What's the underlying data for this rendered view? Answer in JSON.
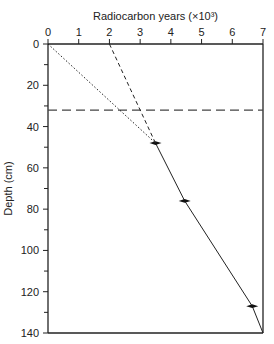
{
  "chart_data": {
    "type": "line",
    "title": "",
    "xlabel": "Radiocarbon years (×10³)",
    "ylabel": "Depth (cm)",
    "xlim": [
      0,
      7
    ],
    "ylim": [
      0,
      140
    ],
    "y_inverted": true,
    "x_axis_position": "top",
    "x_ticks": [
      0,
      1,
      2,
      3,
      4,
      5,
      6,
      7
    ],
    "y_ticks": [
      0,
      20,
      40,
      60,
      80,
      100,
      120,
      140
    ],
    "y_minor_ticks": [
      10,
      30,
      50,
      70,
      90,
      110,
      130
    ],
    "grid": false,
    "series": [
      {
        "name": "dated-profile",
        "style": "solid",
        "x": [
          3.5,
          4.45,
          6.65,
          7.0
        ],
        "y": [
          48,
          76,
          127,
          140
        ],
        "markers": [
          true,
          true,
          true,
          false
        ]
      },
      {
        "name": "extrapolation-to-surface",
        "style": "dotted",
        "x": [
          0,
          3.5
        ],
        "y": [
          0,
          48
        ]
      },
      {
        "name": "alternative-extrapolation",
        "style": "dashed",
        "x": [
          2.0,
          3.5
        ],
        "y": [
          0,
          48
        ]
      }
    ],
    "reference_lines": [
      {
        "orientation": "horizontal",
        "y": 32,
        "style": "long-dashed"
      }
    ]
  }
}
